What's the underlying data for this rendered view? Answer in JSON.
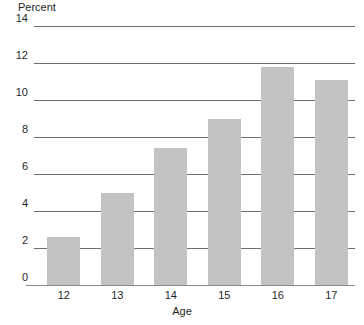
{
  "chart_data": {
    "type": "bar",
    "title": "",
    "xlabel": "Age",
    "ylabel": "Percent",
    "categories": [
      "12",
      "13",
      "14",
      "15",
      "16",
      "17"
    ],
    "values": [
      2.6,
      5.0,
      7.4,
      9.0,
      11.8,
      11.1
    ],
    "ylim": [
      0,
      14
    ],
    "ytick_labels": [
      "0",
      "2",
      "4",
      "6",
      "8",
      "10",
      "12",
      "14"
    ],
    "ytick_values": [
      0,
      2,
      4,
      6,
      8,
      10,
      12,
      14
    ],
    "grid": true,
    "legend": "none",
    "series": [
      {
        "name": "Percent",
        "values": [
          2.6,
          5.0,
          7.4,
          9.0,
          11.8,
          11.1
        ],
        "color": "#c3c3c3"
      }
    ]
  },
  "colors": {
    "bar_fill": "#c3c3c3",
    "gridline": "#6e6e6e",
    "axis_line": "#8b8b8b",
    "text": "#1f1f1f",
    "background": "#ffffff"
  }
}
